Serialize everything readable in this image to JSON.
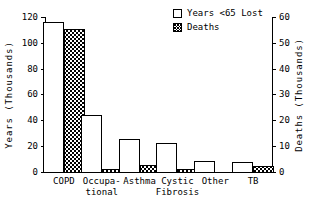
{
  "chart_data": {
    "type": "bar",
    "title": "",
    "subtitle": "",
    "xlabel": "",
    "ylabel": "Years (Thousands)",
    "y2label": "Deaths (Thousands)",
    "grid": false,
    "legend_position": "top-right",
    "categories": [
      "COPD",
      "Occupa-\ntional",
      "Asthma",
      "Cystic\nFibrosis",
      "Other",
      "TB"
    ],
    "category_lines": [
      [
        "COPD"
      ],
      [
        "Occupa-",
        "tional"
      ],
      [
        "Asthma"
      ],
      [
        "Cystic",
        "Fibrosis"
      ],
      [
        "Other"
      ],
      [
        "TB"
      ]
    ],
    "series": [
      {
        "name": "Years <65 Lost",
        "axis": "left",
        "pattern": "open",
        "values": [
          116,
          44,
          25,
          22,
          8,
          7
        ]
      },
      {
        "name": "Deaths",
        "axis": "right",
        "pattern": "checker",
        "values": [
          55,
          0.6,
          2.5,
          0.6,
          0,
          2
        ]
      }
    ],
    "ylim": [
      0,
      120
    ],
    "yticks": [
      0,
      20,
      40,
      60,
      80,
      100,
      120
    ],
    "ytick_labels": [
      "0",
      "20",
      "40",
      "60",
      "80",
      "100",
      "120"
    ],
    "y2lim": [
      0,
      60
    ],
    "y2ticks": [
      0,
      10,
      20,
      30,
      40,
      50,
      60
    ],
    "y2tick_labels": [
      "0",
      "10",
      "20",
      "30",
      "40",
      "50",
      "60"
    ],
    "colors": {
      "open_fill": "#ffffff",
      "checker_fill": "#000000",
      "stroke": "#000000",
      "background": "#ffffff"
    }
  },
  "legend": {
    "entries": [
      {
        "label": "Years <65 Lost",
        "swatch": "open-square-swatch"
      },
      {
        "label": "Deaths",
        "swatch": "checker-square-swatch"
      }
    ]
  },
  "axes": {
    "left_title": "Years (Thousands)",
    "right_title": "Deaths (Thousands)"
  }
}
